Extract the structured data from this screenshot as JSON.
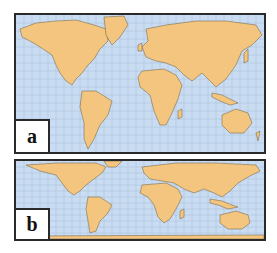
{
  "figure": {
    "panels": [
      {
        "id": "a",
        "label": "a",
        "projection": "Mercator-style world map"
      },
      {
        "id": "b",
        "label": "b",
        "projection": "Equal-area (vertically compressed) world map"
      }
    ],
    "colors": {
      "land": "#f3c57e",
      "ocean": "#c9dcf2",
      "graticule": "#8fa9c9",
      "border": "#2a2a2a",
      "coast": "#6b5a3c"
    }
  }
}
